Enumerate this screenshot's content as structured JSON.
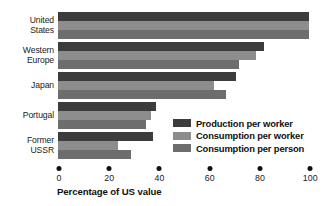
{
  "chart_data": {
    "type": "bar",
    "orientation": "horizontal",
    "title": "",
    "xlabel": "Percentage of US value",
    "ylabel": "",
    "xlim": [
      0,
      100
    ],
    "xticks": [
      0,
      20,
      40,
      60,
      80,
      100
    ],
    "xticklabels": [
      "0",
      "20",
      "40",
      "60",
      "80",
      "100"
    ],
    "grid": false,
    "legend_position": "inside-lower-right",
    "categories": [
      "United States",
      "Western Europe",
      "Japan",
      "Portugal",
      "Former USSR"
    ],
    "category_lines": [
      [
        "United",
        "States"
      ],
      [
        "Western",
        "Europe"
      ],
      [
        "Japan"
      ],
      [
        "Portugal"
      ],
      [
        "Former",
        "USSR"
      ]
    ],
    "series": [
      {
        "name": "Production per worker",
        "color": "#3c3c3c",
        "values": [
          100,
          82,
          71,
          39,
          38
        ]
      },
      {
        "name": "Consumption per worker",
        "color": "#8d8d8d",
        "values": [
          100,
          79,
          62,
          37,
          24
        ]
      },
      {
        "name": "Consumption per person",
        "color": "#6d6d6d",
        "values": [
          100,
          72,
          67,
          35,
          29
        ]
      }
    ]
  },
  "axis": {
    "title": "Percentage of US value"
  }
}
